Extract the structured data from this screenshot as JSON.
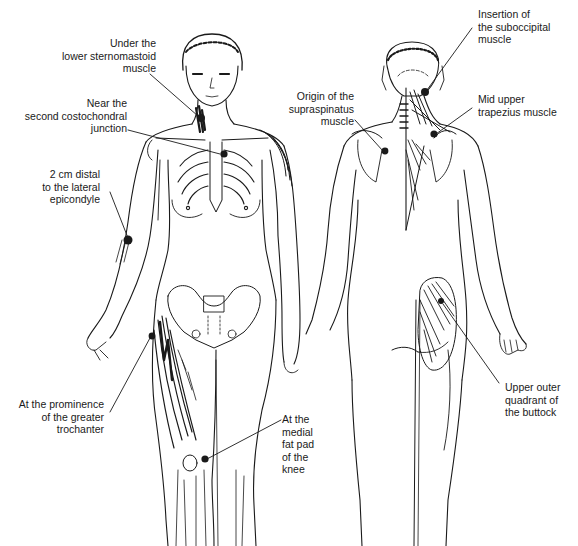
{
  "figure": {
    "views": [
      "anterior-view",
      "posterior-view"
    ],
    "colors": {
      "ink": "#1a1a1a",
      "background": "#ffffff"
    }
  },
  "labels": {
    "sternomastoid": {
      "lines": [
        "Under the",
        "lower sternomastoid",
        "muscle"
      ]
    },
    "costochondral": {
      "lines": [
        "Near the",
        "second costochondral",
        "junction"
      ]
    },
    "epicondyle": {
      "lines": [
        "2 cm distal",
        "to the lateral",
        "epicondyle"
      ]
    },
    "trochanter": {
      "lines": [
        "At the prominence",
        "of the greater",
        "trochanter"
      ]
    },
    "knee": {
      "lines": [
        "At the",
        "medial",
        "fat pad",
        "of the",
        "knee"
      ]
    },
    "suboccipital": {
      "lines": [
        "Insertion of",
        "the suboccipital",
        "muscle"
      ]
    },
    "supraspinatus": {
      "lines": [
        "Origin of the",
        "supraspinatus",
        "muscle"
      ]
    },
    "trapezius": {
      "lines": [
        "Mid upper",
        "trapezius muscle"
      ]
    },
    "buttock": {
      "lines": [
        "Upper outer",
        "quadrant of",
        "the buttock"
      ]
    }
  }
}
